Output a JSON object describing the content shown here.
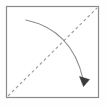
{
  "figure": {
    "type": "diagram",
    "width": 106,
    "height": 107,
    "background_color": "#fefefe"
  },
  "colors": {
    "frame_stroke": "#8a8a8a",
    "frame_fill": "#ffffff",
    "dashed_stroke": "#9a9a9a",
    "curve_stroke": "#8c8c8c",
    "arrowhead_fill": "#3a3a3a"
  },
  "shapes": {
    "frame": {
      "name": "square-frame",
      "x": 6.5,
      "y": 6.5,
      "width": 92,
      "height": 91,
      "stroke_width": 1.2
    },
    "diagonal": {
      "name": "dashed-diagonal",
      "x1": 8,
      "y1": 96,
      "x2": 97,
      "y2": 8,
      "stroke_width": 1.1,
      "dash_pattern": "3 2.6"
    },
    "curve": {
      "name": "curved-arrow",
      "start_x": 26,
      "start_y": 20,
      "control_x": 72,
      "control_y": 30,
      "end_x": 83,
      "end_y": 79,
      "stroke_width": 1.1
    },
    "arrowhead": {
      "name": "arrowhead",
      "points": "83.5,86.5 79.5,76.5 89.5,79.5",
      "tip_x": 85,
      "tip_y": 86
    },
    "crossing_point": {
      "name": "crossing-point",
      "x": 60,
      "y": 47
    }
  },
  "labels": {
    "figure_caption": "",
    "diagonal_label": "",
    "curve_label": ""
  }
}
